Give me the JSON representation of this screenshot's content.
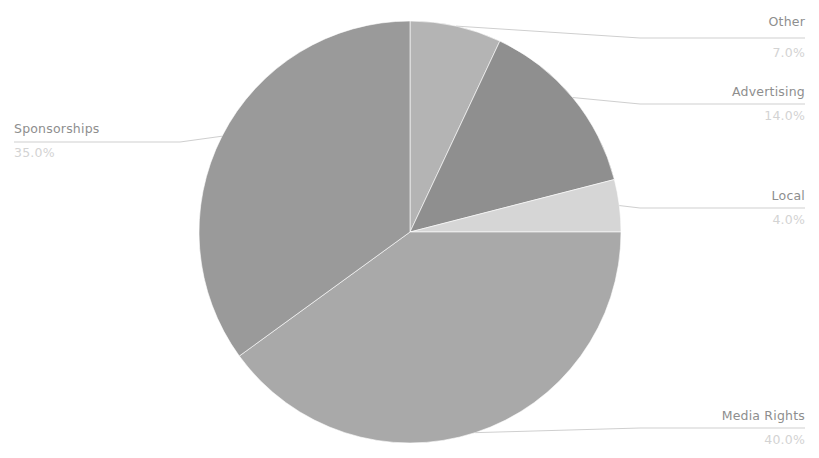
{
  "title_remnant": "",
  "chart_data": {
    "type": "pie",
    "title": "",
    "subtitle": "",
    "xlabel": "",
    "ylabel": "",
    "legend": "none",
    "grid": false,
    "label_format": "name above, percent below",
    "start_angle_deg": 0,
    "direction": "clockwise",
    "center": {
      "x": 410,
      "y": 232,
      "radius": 211
    },
    "categories": [
      "Other",
      "Advertising",
      "Local",
      "Media Rights",
      "Sponsorships"
    ],
    "values": [
      7.0,
      14.0,
      4.0,
      40.0,
      35.0
    ],
    "value_labels": [
      "7.0%",
      "14.0%",
      "4.0%",
      "40.0%",
      "35.0%"
    ],
    "colors": [
      "#b4b4b4",
      "#8f8f8f",
      "#d6d6d6",
      "#a9a9a9",
      "#9a9a9a"
    ],
    "slices": [
      {
        "name": "Other",
        "value": 7.0,
        "percent_label": "7.0%",
        "color": "#b4b4b4",
        "label_x": 800,
        "label_name_y": 26,
        "label_pct_y": 57,
        "leader_y": 38,
        "leader_x_end": 640
      },
      {
        "name": "Advertising",
        "value": 14.0,
        "percent_label": "14.0%",
        "color": "#8f8f8f",
        "label_x": 800,
        "label_name_y": 96,
        "label_pct_y": 120,
        "leader_y": 104,
        "leader_x_end": 640
      },
      {
        "name": "Local",
        "value": 4.0,
        "percent_label": "4.0%",
        "color": "#d6d6d6",
        "label_x": 800,
        "label_name_y": 200,
        "label_pct_y": 224,
        "leader_y": 208,
        "leader_x_end": 640
      },
      {
        "name": "Media Rights",
        "value": 40.0,
        "percent_label": "40.0%",
        "color": "#a9a9a9",
        "label_x": 800,
        "label_name_y": 420,
        "label_pct_y": 444,
        "leader_y": 428,
        "leader_x_end": 640
      },
      {
        "name": "Sponsorships",
        "value": 35.0,
        "percent_label": "35.0%",
        "color": "#9a9a9a",
        "label_x": 14,
        "label_name_y": 133,
        "label_pct_y": 157,
        "leader_y": 142,
        "leader_x_end": 180
      }
    ]
  },
  "colors": {
    "background": "#ffffff",
    "label_name": "#8e8e8e",
    "label_percent": "#d3d3d3",
    "leader_line": "#cfcfcf"
  }
}
